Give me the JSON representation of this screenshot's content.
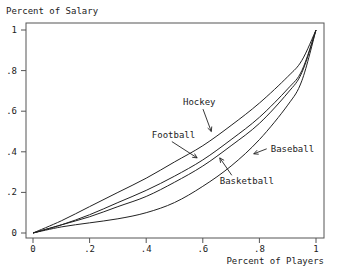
{
  "chart_data": {
    "type": "line",
    "title": "",
    "ylabel": "Percent of Salary",
    "xlabel": "Percent of Players",
    "xlim": [
      0,
      1
    ],
    "ylim": [
      0,
      1
    ],
    "grid": false,
    "legend": "none (inline annotations with arrows)",
    "x_ticks": [
      "0",
      ".2",
      ".4",
      ".6",
      ".8",
      "1"
    ],
    "y_ticks": [
      "0",
      ".2",
      ".4",
      ".6",
      ".8",
      "1"
    ],
    "x": [
      0,
      0.1,
      0.2,
      0.3,
      0.4,
      0.5,
      0.6,
      0.7,
      0.8,
      0.9,
      0.95,
      1
    ],
    "series": [
      {
        "name": "Hockey",
        "values": [
          0,
          0.06,
          0.13,
          0.2,
          0.27,
          0.35,
          0.43,
          0.53,
          0.64,
          0.77,
          0.85,
          1
        ]
      },
      {
        "name": "Football",
        "values": [
          0,
          0.04,
          0.09,
          0.15,
          0.21,
          0.28,
          0.36,
          0.46,
          0.57,
          0.71,
          0.8,
          1
        ]
      },
      {
        "name": "Basketball",
        "values": [
          0,
          0.04,
          0.08,
          0.13,
          0.18,
          0.25,
          0.33,
          0.43,
          0.54,
          0.69,
          0.79,
          1
        ]
      },
      {
        "name": "Baseball",
        "values": [
          0,
          0.03,
          0.05,
          0.07,
          0.1,
          0.15,
          0.23,
          0.33,
          0.46,
          0.63,
          0.75,
          1
        ]
      }
    ],
    "annotations": [
      {
        "text": "Hockey",
        "pos": [
          0.53,
          0.63
        ],
        "arrow_to": [
          0.63,
          0.5
        ]
      },
      {
        "text": "Football",
        "pos": [
          0.42,
          0.47
        ],
        "arrow_to": [
          0.58,
          0.37
        ]
      },
      {
        "text": "Basketball",
        "pos": [
          0.66,
          0.24
        ],
        "arrow_to": [
          0.66,
          0.37
        ]
      },
      {
        "text": "Baseball",
        "pos": [
          0.84,
          0.4
        ],
        "arrow_to": [
          0.78,
          0.39
        ]
      }
    ]
  }
}
